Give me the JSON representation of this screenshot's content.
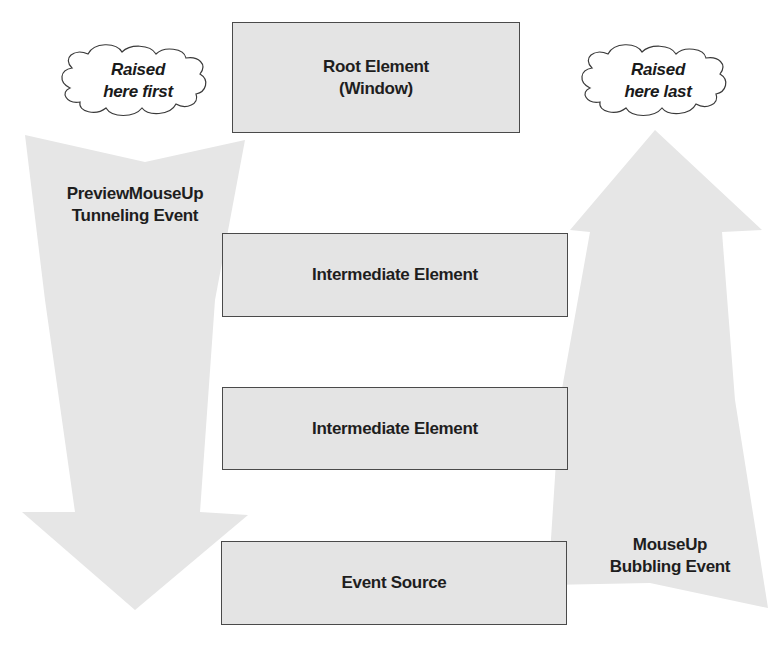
{
  "diagram": {
    "colors": {
      "arrow_fill": "#e6e6e6",
      "box_fill": "#e4e4e4",
      "box_border": "#4a4a4a",
      "text": "#1e1e1e",
      "background": "#ffffff"
    },
    "clouds": {
      "first": "Raised\nhere first",
      "last": "Raised\nhere last"
    },
    "arrows": {
      "tunneling": {
        "direction": "down",
        "label": "PreviewMouseUp\nTunneling Event"
      },
      "bubbling": {
        "direction": "up",
        "label": "MouseUp\nBubbling Event"
      }
    },
    "elements": [
      {
        "label": "Root Element\n(Window)"
      },
      {
        "label": "Intermediate Element"
      },
      {
        "label": "Intermediate Element"
      },
      {
        "label": "Event Source"
      }
    ]
  }
}
